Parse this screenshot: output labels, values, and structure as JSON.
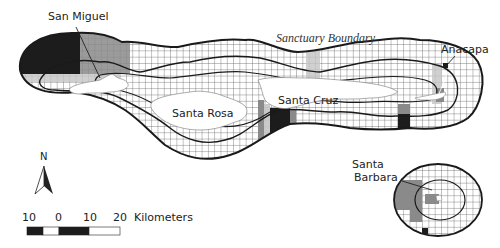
{
  "map": {
    "title": "Channel Islands National Marine Sanctuary",
    "boundary_label": "Sanctuary Boundary",
    "islands": [
      {
        "name": "San Miguel"
      },
      {
        "name": "Santa Rosa"
      },
      {
        "name": "Santa Cruz"
      },
      {
        "name": "Anacapa"
      },
      {
        "name": "Santa Barbara",
        "label_line1": "Santa",
        "label_line2": "Barbara"
      }
    ],
    "north_arrow": {
      "label": "N"
    },
    "scale_bar": {
      "ticks": [
        "10",
        "0",
        "10",
        "20"
      ],
      "unit": "Kilometers"
    },
    "colors": {
      "grid": "#555555",
      "boundary": "#1a1a1a",
      "dark_cell": "#1c1c1c",
      "mid_cell": "#8a8a8a",
      "light_cell": "#c4c4c4",
      "land": "#ffffff"
    }
  }
}
